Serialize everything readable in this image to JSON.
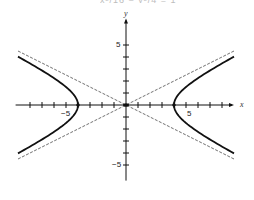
{
  "header": {
    "clipped_text": "x²/16 − y²/4 = 1"
  },
  "chart_data": {
    "type": "line",
    "title": "",
    "xlabel": "x",
    "ylabel": "y",
    "xlim": [
      -9.2,
      9.0
    ],
    "ylim": [
      -6.3,
      7.2
    ],
    "x_ticks": [
      -8,
      -7,
      -6,
      -5,
      -4,
      -3,
      -2,
      -1,
      1,
      2,
      3,
      4,
      5,
      6,
      7,
      8
    ],
    "y_ticks": [
      -5,
      -4,
      -3,
      -2,
      -1,
      1,
      2,
      3,
      4,
      5
    ],
    "tick_labels": {
      "x": [
        {
          "value": -5,
          "text": "−5"
        },
        {
          "value": 5,
          "text": "5"
        }
      ],
      "y": [
        {
          "value": 5,
          "text": "5"
        },
        {
          "value": -5,
          "text": "−5"
        }
      ]
    },
    "grid": false,
    "legend": null,
    "series": [
      {
        "name": "hyperbola",
        "equation": "x^2/16 - y^2/4 = 1",
        "a": 4,
        "b": 2,
        "style": "solid-bold",
        "vertices": [
          [
            -4,
            0
          ],
          [
            4,
            0
          ]
        ],
        "x_extent": 9
      },
      {
        "name": "asymptote-1",
        "equation": "y = x/2",
        "style": "dashed"
      },
      {
        "name": "asymptote-2",
        "equation": "y = -x/2",
        "style": "dashed"
      }
    ]
  },
  "layout": {
    "origin_px": [
      126,
      105
    ],
    "unit_px": 12,
    "color": "#111111"
  }
}
